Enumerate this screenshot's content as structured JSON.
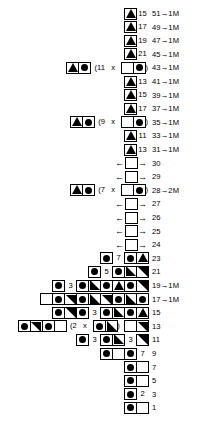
{
  "chart": {
    "symbols": {
      "circle": "filled-circle",
      "triangle": "filled-up-triangle",
      "lower-left": "filled-lower-left-triangle",
      "upper-right": "filled-upper-right-triangle",
      "empty": "empty-square",
      "arrow-left": "←",
      "arrow-right": "→"
    },
    "rows": [
      {
        "label": "51→1M",
        "items": [
          {
            "t": "cell",
            "g": "tri"
          },
          {
            "t": "num",
            "v": "15"
          }
        ]
      },
      {
        "label": "49→1M",
        "items": [
          {
            "t": "cell",
            "g": "tri"
          },
          {
            "t": "num",
            "v": "17"
          }
        ]
      },
      {
        "label": "47→1M",
        "items": [
          {
            "t": "cell",
            "g": "tri"
          },
          {
            "t": "num",
            "v": "19"
          }
        ]
      },
      {
        "label": "45→1M",
        "items": [
          {
            "t": "cell",
            "g": "tri"
          },
          {
            "t": "num",
            "v": "21"
          }
        ]
      },
      {
        "label": "43→1M",
        "items": [
          {
            "t": "cell",
            "g": "tri"
          },
          {
            "t": "cell",
            "g": "circle"
          },
          {
            "t": "txt",
            "v": "  ("
          },
          {
            "t": "txt",
            "v": "11"
          },
          {
            "t": "txt",
            "v": "   x   "
          },
          {
            "t": "cell",
            "g": "empty"
          },
          {
            "t": "cell",
            "g": "circle"
          },
          {
            "t": "txt",
            "v": ")"
          }
        ]
      },
      {
        "label": "41→1M",
        "items": [
          {
            "t": "cell",
            "g": "tri"
          },
          {
            "t": "num",
            "v": "13"
          }
        ]
      },
      {
        "label": "39→1M",
        "items": [
          {
            "t": "cell",
            "g": "tri"
          },
          {
            "t": "num",
            "v": "15"
          }
        ]
      },
      {
        "label": "37→1M",
        "items": [
          {
            "t": "cell",
            "g": "tri"
          },
          {
            "t": "num",
            "v": "17"
          }
        ]
      },
      {
        "label": "35→1M",
        "items": [
          {
            "t": "cell",
            "g": "tri"
          },
          {
            "t": "cell",
            "g": "circle"
          },
          {
            "t": "txt",
            "v": "  ("
          },
          {
            "t": "txt",
            "v": "9"
          },
          {
            "t": "txt",
            "v": "   x   "
          },
          {
            "t": "cell",
            "g": "empty"
          },
          {
            "t": "cell",
            "g": "circle"
          },
          {
            "t": "txt",
            "v": ")"
          }
        ]
      },
      {
        "label": "33→1M",
        "items": [
          {
            "t": "cell",
            "g": "tri"
          },
          {
            "t": "num",
            "v": "11"
          }
        ]
      },
      {
        "label": "31→1M",
        "items": [
          {
            "t": "cell",
            "g": "tri"
          },
          {
            "t": "num",
            "v": "13"
          }
        ]
      },
      {
        "label": "30",
        "items": [
          {
            "t": "arrow",
            "v": "←"
          },
          {
            "t": "cell",
            "g": "empty"
          },
          {
            "t": "arrow",
            "v": "→"
          }
        ]
      },
      {
        "label": "29",
        "items": [
          {
            "t": "arrow",
            "v": "←"
          },
          {
            "t": "cell",
            "g": "empty"
          },
          {
            "t": "arrow",
            "v": "→"
          }
        ]
      },
      {
        "label": "28→2M",
        "items": [
          {
            "t": "cell",
            "g": "tri"
          },
          {
            "t": "cell",
            "g": "circle"
          },
          {
            "t": "txt",
            "v": "  ("
          },
          {
            "t": "txt",
            "v": "7"
          },
          {
            "t": "txt",
            "v": "   x   "
          },
          {
            "t": "cell",
            "g": "empty"
          },
          {
            "t": "cell",
            "g": "circle"
          },
          {
            "t": "txt",
            "v": ")"
          }
        ]
      },
      {
        "label": "27",
        "items": [
          {
            "t": "arrow",
            "v": "←"
          },
          {
            "t": "cell",
            "g": "empty"
          },
          {
            "t": "arrow",
            "v": "→"
          }
        ]
      },
      {
        "label": "26",
        "items": [
          {
            "t": "arrow",
            "v": "←"
          },
          {
            "t": "cell",
            "g": "empty"
          },
          {
            "t": "arrow",
            "v": "→"
          }
        ]
      },
      {
        "label": "25",
        "items": [
          {
            "t": "arrow",
            "v": "←"
          },
          {
            "t": "cell",
            "g": "empty"
          },
          {
            "t": "arrow",
            "v": "→"
          }
        ]
      },
      {
        "label": "24",
        "items": [
          {
            "t": "arrow",
            "v": "←"
          },
          {
            "t": "cell",
            "g": "empty"
          },
          {
            "t": "arrow",
            "v": "→"
          }
        ]
      },
      {
        "label": "23",
        "items": [
          {
            "t": "cell",
            "g": "circle"
          },
          {
            "t": "num",
            "v": "7"
          },
          {
            "t": "cell",
            "g": "circle"
          },
          {
            "t": "cell",
            "g": "tri"
          }
        ]
      },
      {
        "label": "21",
        "items": [
          {
            "t": "cell",
            "g": "circle"
          },
          {
            "t": "num",
            "v": "5"
          },
          {
            "t": "cell",
            "g": "circle"
          },
          {
            "t": "cell",
            "g": "ll"
          },
          {
            "t": "cell",
            "g": "ur"
          }
        ]
      },
      {
        "label": "19→1M",
        "items": [
          {
            "t": "cell",
            "g": "circle"
          },
          {
            "t": "num",
            "v": "3"
          },
          {
            "t": "cell",
            "g": "circle"
          },
          {
            "t": "cell",
            "g": "ll"
          },
          {
            "t": "cell",
            "g": "circle"
          },
          {
            "t": "cell",
            "g": "tri"
          },
          {
            "t": "cell",
            "g": "circle"
          },
          {
            "t": "cell",
            "g": "ur"
          }
        ]
      },
      {
        "label": "17→1M",
        "items": [
          {
            "t": "cell",
            "g": "empty"
          },
          {
            "t": "cell",
            "g": "circle"
          },
          {
            "t": "cell",
            "g": "ur"
          },
          {
            "t": "cell",
            "g": "circle"
          },
          {
            "t": "cell",
            "g": "ll"
          },
          {
            "t": "cell",
            "g": "ur"
          },
          {
            "t": "cell",
            "g": "circle"
          },
          {
            "t": "cell",
            "g": "ll"
          },
          {
            "t": "cell",
            "g": "circle"
          }
        ]
      },
      {
        "label": "15",
        "items": [
          {
            "t": "cell",
            "g": "circle"
          },
          {
            "t": "cell",
            "g": "ur"
          },
          {
            "t": "cell",
            "g": "circle"
          },
          {
            "t": "num",
            "v": "3"
          },
          {
            "t": "cell",
            "g": "circle"
          },
          {
            "t": "cell",
            "g": "ll"
          },
          {
            "t": "cell",
            "g": "circle"
          },
          {
            "t": "cell",
            "g": "tri"
          }
        ]
      },
      {
        "label": "13",
        "items": [
          {
            "t": "cell",
            "g": "circle"
          },
          {
            "t": "cell",
            "g": "ur"
          },
          {
            "t": "cell",
            "g": "circle"
          },
          {
            "t": "cell",
            "g": "empty"
          },
          {
            "t": "txt",
            "v": "  ("
          },
          {
            "t": "txt",
            "v": "2"
          },
          {
            "t": "txt",
            "v": "   x   "
          },
          {
            "t": "cell",
            "g": "circle"
          },
          {
            "t": "cell",
            "g": "ll"
          },
          {
            "t": "txt",
            "v": ")  "
          },
          {
            "t": "cell",
            "g": "empty"
          },
          {
            "t": "cell",
            "g": "ur"
          }
        ]
      },
      {
        "label": "11",
        "items": [
          {
            "t": "cell",
            "g": "circle"
          },
          {
            "t": "num",
            "v": "3"
          },
          {
            "t": "cell",
            "g": "circle"
          },
          {
            "t": "cell",
            "g": "ll"
          },
          {
            "t": "num",
            "v": "3"
          },
          {
            "t": "cell",
            "g": "ur"
          }
        ]
      },
      {
        "label": "9",
        "items": [
          {
            "t": "cell",
            "g": "circle"
          },
          {
            "t": "cell",
            "g": "empty"
          },
          {
            "t": "cell",
            "g": "circle"
          },
          {
            "t": "num",
            "v": "7"
          }
        ]
      },
      {
        "label": "7",
        "items": [
          {
            "t": "cell",
            "g": "circle"
          },
          {
            "t": "cell",
            "g": "empty"
          }
        ]
      },
      {
        "label": "5",
        "items": [
          {
            "t": "cell",
            "g": "circle"
          },
          {
            "t": "cell",
            "g": "empty"
          }
        ]
      },
      {
        "label": "3",
        "items": [
          {
            "t": "cell",
            "g": "circle"
          },
          {
            "t": "num",
            "v": "2"
          }
        ]
      },
      {
        "label": "1",
        "items": [
          {
            "t": "cell",
            "g": "circle"
          },
          {
            "t": "cell",
            "g": "empty"
          }
        ]
      }
    ]
  }
}
